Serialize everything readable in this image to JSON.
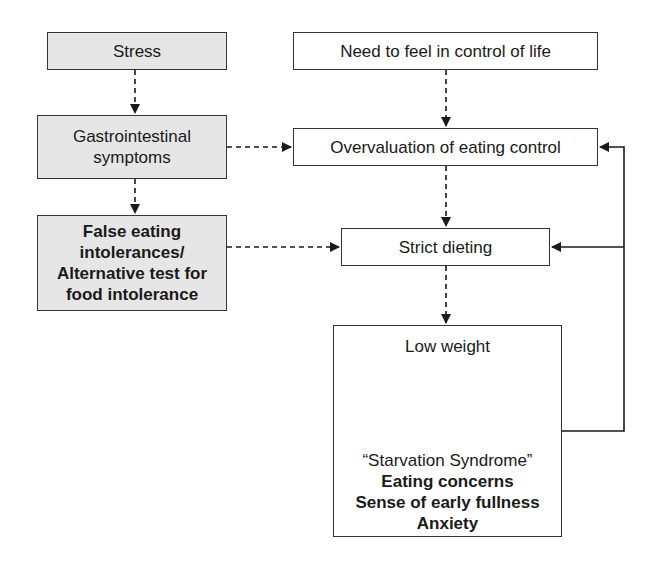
{
  "diagram": {
    "nodes": {
      "stress": {
        "label": "Stress",
        "shaded": true
      },
      "gastro": {
        "lines": [
          "Gastrointestinal",
          "symptoms"
        ],
        "shaded": true
      },
      "false_eating": {
        "lines": [
          "False eating",
          "intolerances/",
          "Alternative test for",
          "food intolerance"
        ],
        "shaded": true,
        "bold": true
      },
      "need_control": {
        "label": "Need to feel in control of life",
        "shaded": false
      },
      "overvaluation": {
        "label": "Overvaluation of eating control",
        "shaded": false
      },
      "strict_dieting": {
        "label": "Strict dieting",
        "shaded": false
      },
      "low_weight": {
        "label": "Low weight",
        "starvation_title": "“Starvation  Syndrome”",
        "symptoms": [
          "Eating concerns",
          "Sense of early fullness",
          "Anxiety"
        ]
      }
    },
    "edges": [
      {
        "from": "stress",
        "to": "gastro",
        "style": "dashed"
      },
      {
        "from": "gastro",
        "to": "false_eating",
        "style": "dashed"
      },
      {
        "from": "gastro",
        "to": "overvaluation",
        "style": "dashed"
      },
      {
        "from": "false_eating",
        "to": "strict_dieting",
        "style": "dashed"
      },
      {
        "from": "need_control",
        "to": "overvaluation",
        "style": "dashed"
      },
      {
        "from": "overvaluation",
        "to": "strict_dieting",
        "style": "dashed"
      },
      {
        "from": "strict_dieting",
        "to": "low_weight",
        "style": "dashed"
      },
      {
        "from": "low_weight",
        "to": "starvation_syndrome",
        "style": "dashed"
      },
      {
        "from": "low_weight_box",
        "to": "overvaluation",
        "style": "solid"
      },
      {
        "from": "low_weight_box",
        "to": "strict_dieting",
        "style": "solid"
      }
    ],
    "colors": {
      "shaded_fill": "#e6e6e6",
      "border": "#333333",
      "text": "#1a1a1a"
    }
  }
}
